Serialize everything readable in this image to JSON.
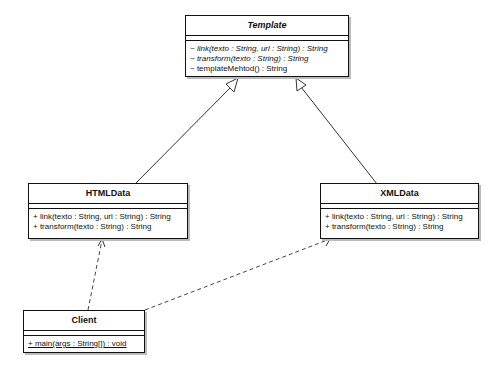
{
  "diagram": {
    "type": "UML class diagram",
    "classes": {
      "template": {
        "name": "Template",
        "abstract": true,
        "operations": [
          "~ link(texto : String, url : String) : String",
          "~ transform(texto : String) : String",
          "~ templateMehtod() : String"
        ]
      },
      "htmldata": {
        "name": "HTMLData",
        "operations": [
          "+ link(texto : String, url : String) : String",
          "+ transform(texto : String) : String"
        ]
      },
      "xmldata": {
        "name": "XMLData",
        "operations": [
          "+ link(texto : String, url : String) : String",
          "+ transform(texto : String) : String"
        ]
      },
      "client": {
        "name": "Client",
        "operations": [
          "+ main(args : String[]) : void"
        ]
      }
    },
    "relationships": [
      {
        "type": "generalization",
        "from": "HTMLData",
        "to": "Template"
      },
      {
        "type": "generalization",
        "from": "XMLData",
        "to": "Template"
      },
      {
        "type": "dependency",
        "from": "Client",
        "to": "HTMLData"
      },
      {
        "type": "dependency",
        "from": "Client",
        "to": "XMLData"
      }
    ]
  }
}
